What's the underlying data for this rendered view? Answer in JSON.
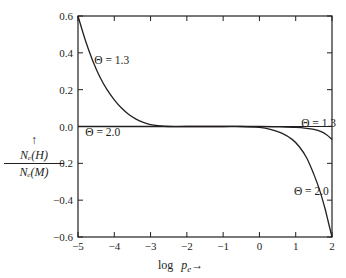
{
  "chart_data": {
    "type": "line",
    "title": "",
    "xlabel": "log p_e →",
    "xlabel_parts": {
      "prefix": "log",
      "variable": "p",
      "subscript": "e",
      "arrow": "→"
    },
    "ylabel": "↑ N_e(H) / N_e(M)",
    "ylabel_parts": {
      "arrow": "↑",
      "numerator": "Nₑ(H)",
      "denominator": "Nₑ(M)"
    },
    "xlim": [
      -5,
      2
    ],
    "ylim": [
      -0.6,
      0.6
    ],
    "xticks": [
      -5,
      -4,
      -3,
      -2,
      -1,
      0,
      1,
      2
    ],
    "xtick_labels": [
      "−5",
      "−4",
      "−3",
      "−2",
      "−1",
      "0",
      "1",
      "2"
    ],
    "yticks": [
      0.6,
      0.4,
      0.2,
      0.0,
      -0.2,
      -0.4,
      -0.6
    ],
    "ytick_labels": [
      "0.6",
      "0.4",
      "0.2",
      "0.0",
      "−0.2",
      "−0.4",
      "−0.6"
    ],
    "grid": false,
    "legend": "none (inline curve annotations)",
    "series": [
      {
        "name": "Θ = 1.3",
        "x": [
          -5.0,
          -4.8,
          -4.6,
          -4.4,
          -4.2,
          -4.0,
          -3.8,
          -3.6,
          -3.4,
          -3.2,
          -3.0,
          -2.8,
          -2.5,
          -2.0,
          -1.0,
          0.0,
          0.5,
          1.0,
          1.3,
          1.5,
          1.7,
          1.85,
          2.0
        ],
        "y": [
          0.6,
          0.47,
          0.36,
          0.27,
          0.2,
          0.145,
          0.1,
          0.065,
          0.04,
          0.022,
          0.01,
          0.004,
          0.0,
          0.0,
          0.0,
          0.0,
          -0.002,
          -0.005,
          -0.01,
          -0.016,
          -0.028,
          -0.045,
          -0.07
        ]
      },
      {
        "name": "Θ = 2.0",
        "x": [
          -5.0,
          -2.0,
          -1.0,
          -0.5,
          0.0,
          0.3,
          0.6,
          0.9,
          1.1,
          1.3,
          1.5,
          1.65,
          1.8,
          1.9,
          2.0
        ],
        "y": [
          0.0,
          0.0,
          0.0,
          0.0,
          -0.005,
          -0.015,
          -0.035,
          -0.07,
          -0.11,
          -0.17,
          -0.26,
          -0.34,
          -0.44,
          -0.52,
          -0.6
        ]
      }
    ],
    "annotations": [
      {
        "text": "Θ = 1.3",
        "x": -4.55,
        "y": 0.36,
        "series": "Θ = 1.3"
      },
      {
        "text": "Θ = 2.0",
        "x": -4.8,
        "y": -0.03,
        "series": "Θ = 2.0"
      },
      {
        "text": "Θ = 1.3",
        "x": 1.15,
        "y": 0.02,
        "series": "Θ = 1.3"
      },
      {
        "text": "Θ = 2.0",
        "x": 0.95,
        "y": -0.35,
        "series": "Θ = 2.0"
      }
    ]
  }
}
